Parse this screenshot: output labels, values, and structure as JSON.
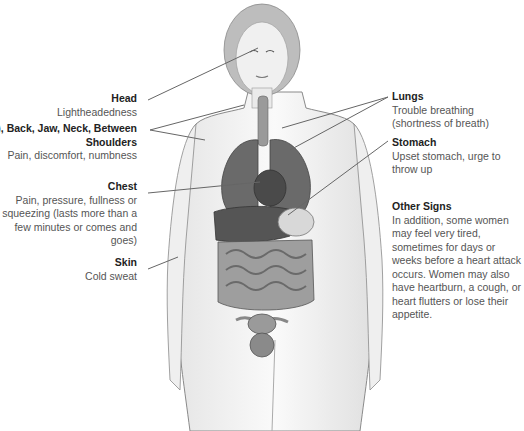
{
  "diagram": {
    "labels_left": [
      {
        "id": "head",
        "title": "Head",
        "desc": "Lightheadedness"
      },
      {
        "id": "arms",
        "title": "Arm(s), Back, Jaw, Neck, Between Shoulders",
        "desc": "Pain, discomfort, numbness"
      },
      {
        "id": "chest",
        "title": "Chest",
        "desc": "Pain, pressure, fullness or squeezing (lasts more than a few minutes or comes and goes)"
      },
      {
        "id": "skin",
        "title": "Skin",
        "desc": "Cold sweat"
      }
    ],
    "labels_right": [
      {
        "id": "lungs",
        "title": "Lungs",
        "desc": "Trouble breathing (shortness of breath)"
      },
      {
        "id": "stomach",
        "title": "Stomach",
        "desc": "Upset stomach, urge to throw up"
      },
      {
        "id": "other",
        "title": "Other Signs",
        "desc": "In addition, some women may feel very tired, sometimes for days or weeks before a heart attack occurs. Women may also have heartburn, a cough, or heart flutters or lose their appetite."
      }
    ],
    "colors": {
      "outline": "#8a8a8a",
      "skin": "#f2f2f2",
      "organ_dark": "#555555",
      "organ_mid": "#8c8c8c",
      "leader": "#666666"
    }
  }
}
